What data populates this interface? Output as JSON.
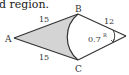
{
  "caption": "d region.",
  "diagram": {
    "type": "geometry-figure",
    "points": {
      "A": {
        "label": "A"
      },
      "B": {
        "label": "B"
      },
      "C": {
        "label": "C"
      }
    },
    "edge_labels": {
      "AB": "15",
      "AC": "15",
      "BD": "12"
    },
    "angle_label": "0.7",
    "angle_unit": "R",
    "shaded_region": "region between triangle ABC sides and arc BC",
    "colors": {
      "shade": "#d4d4d4",
      "line": "#333333"
    }
  }
}
